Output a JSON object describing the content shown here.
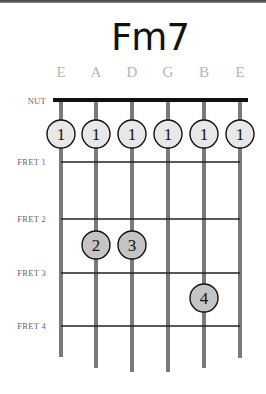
{
  "title": "Fm7",
  "strings": [
    {
      "label": "E",
      "x": 61,
      "end_y": 357
    },
    {
      "label": "A",
      "x": 96,
      "end_y": 368
    },
    {
      "label": "D",
      "x": 132,
      "end_y": 372
    },
    {
      "label": "G",
      "x": 168,
      "end_y": 372
    },
    {
      "label": "B",
      "x": 204,
      "end_y": 368
    },
    {
      "label": "E",
      "x": 240,
      "end_y": 358
    }
  ],
  "nut_label": "NUT",
  "frets": [
    {
      "label": "FRET 1",
      "y": 162
    },
    {
      "label": "FRET 2",
      "y": 219
    },
    {
      "label": "FRET 3",
      "y": 273
    },
    {
      "label": "FRET 4",
      "y": 326
    }
  ],
  "fingers": [
    {
      "string": 0,
      "y": 134,
      "finger": "1",
      "fill": "#e8e8e8"
    },
    {
      "string": 1,
      "y": 134,
      "finger": "1",
      "fill": "#e8e8e8"
    },
    {
      "string": 2,
      "y": 134,
      "finger": "1",
      "fill": "#e8e8e8"
    },
    {
      "string": 3,
      "y": 134,
      "finger": "1",
      "fill": "#e8e8e8"
    },
    {
      "string": 4,
      "y": 134,
      "finger": "1",
      "fill": "#e8e8e8"
    },
    {
      "string": 5,
      "y": 134,
      "finger": "1",
      "fill": "#e8e8e8"
    },
    {
      "string": 1,
      "y": 245,
      "finger": "2",
      "fill": "#c4c4c4"
    },
    {
      "string": 2,
      "y": 245,
      "finger": "3",
      "fill": "#c4c4c4"
    },
    {
      "string": 4,
      "y": 298,
      "finger": "4",
      "fill": "#c4c4c4"
    }
  ],
  "colors": {
    "string": "#7a7a7a",
    "nut": "#111111",
    "fret": "#222222"
  }
}
